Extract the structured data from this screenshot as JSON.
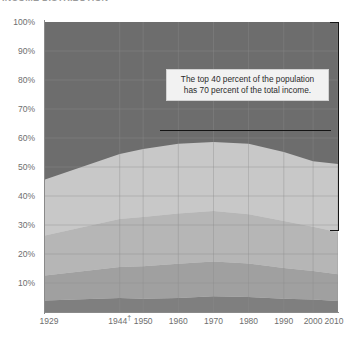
{
  "title": "INCOME DISTRIBUTION",
  "colors": {
    "band_top": "#6d6d6d",
    "band_4": "#c8c8c8",
    "band_3": "#b6b6b6",
    "band_2": "#a0a0a0",
    "band_1": "#7f7f7f",
    "gridline": "#8d8d8d",
    "axis": "#8a8a8a",
    "annotation_text": "#2b2b2b",
    "leader": "#141414",
    "tick_label": "#6e6e6e"
  },
  "annotation": {
    "line1": "The top 40 percent of the population",
    "line2": "has 70 percent of the total income."
  },
  "chart_data": {
    "type": "area",
    "title": "INCOME DISTRIBUTION",
    "xlabel": "",
    "ylabel": "",
    "ylim": [
      0,
      100
    ],
    "ytick_labels": [
      "100%",
      "90%",
      "80%",
      "70%",
      "60%",
      "50%",
      "40%",
      "30%",
      "20%",
      "10%"
    ],
    "ytick_values": [
      100,
      90,
      80,
      70,
      60,
      50,
      40,
      30,
      20,
      10
    ],
    "xtick_labels": [
      "1929",
      "1944†",
      "1950",
      "1960",
      "1970",
      "1980",
      "1990",
      "2000",
      "2010"
    ],
    "xtick_values": [
      1929,
      1944,
      1950,
      1960,
      1970,
      1980,
      1990,
      2000,
      2010
    ],
    "grid": true,
    "legend": "none",
    "stacked_percent": true,
    "x": [
      1929,
      1944,
      1950,
      1960,
      1970,
      1980,
      1990,
      2000,
      2010
    ],
    "series": [
      {
        "name": "Lowest quintile",
        "values": [
          4.0,
          4.8,
          4.6,
          4.8,
          5.4,
          5.2,
          4.6,
          4.3,
          3.8
        ]
      },
      {
        "name": "Second quintile",
        "values": [
          8.6,
          10.7,
          11.2,
          11.8,
          12.0,
          11.5,
          10.6,
          9.8,
          9.2
        ]
      },
      {
        "name": "Middle quintile",
        "values": [
          13.8,
          16.6,
          17.0,
          17.4,
          17.4,
          17.0,
          16.2,
          15.3,
          14.5
        ]
      },
      {
        "name": "Fourth quintile",
        "values": [
          19.3,
          22.4,
          23.4,
          24.0,
          23.8,
          24.3,
          23.8,
          22.6,
          23.5
        ]
      },
      {
        "name": "Highest quintile",
        "values": [
          54.3,
          45.5,
          43.8,
          42.0,
          41.4,
          42.0,
          44.8,
          48.0,
          49.0
        ]
      }
    ],
    "band_boundaries_cumulative": {
      "note": "cumulative top edge of each band, bottom-up, in percent",
      "b1": [
        4.0,
        4.8,
        4.6,
        4.8,
        5.4,
        5.2,
        4.6,
        4.3,
        3.8
      ],
      "b2": [
        12.6,
        15.5,
        15.8,
        16.6,
        17.4,
        16.7,
        15.2,
        14.1,
        13.0
      ],
      "b3": [
        26.4,
        32.1,
        32.8,
        34.0,
        34.8,
        33.7,
        31.4,
        29.4,
        27.5
      ],
      "b4": [
        45.7,
        54.5,
        56.2,
        58.0,
        58.6,
        58.0,
        55.2,
        52.0,
        51.0
      ],
      "b5": [
        100,
        100,
        100,
        100,
        100,
        100,
        100,
        100,
        100
      ]
    },
    "annotations": [
      {
        "text": "The top 40 percent of the population has 70 percent of the total income.",
        "bracket_from": 100,
        "bracket_to": 30,
        "leader_y": 70
      }
    ]
  }
}
